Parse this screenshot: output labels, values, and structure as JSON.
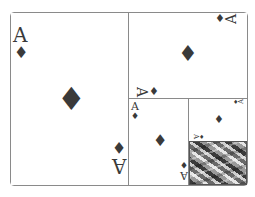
{
  "cards": {
    "large": {
      "rank": "A",
      "suit": "♦",
      "orientation": "portrait"
    },
    "top_right": {
      "rank": "A",
      "suit": "♦",
      "orientation": "landscape"
    },
    "mid": {
      "rank": "A",
      "suit": "♦",
      "orientation": "portrait"
    },
    "small": {
      "rank": "A",
      "suit": "♦",
      "orientation": "landscape"
    }
  },
  "card_back": {
    "pattern": "gray-camo-weave",
    "colors": [
      "#3b3b3b",
      "#6a6a6a",
      "#9a9a9a",
      "#cfcfcf",
      "#e6e6e6"
    ]
  },
  "colors": {
    "ink": "#3a3a3a",
    "border": "#8a8a8a",
    "background": "#ffffff"
  }
}
